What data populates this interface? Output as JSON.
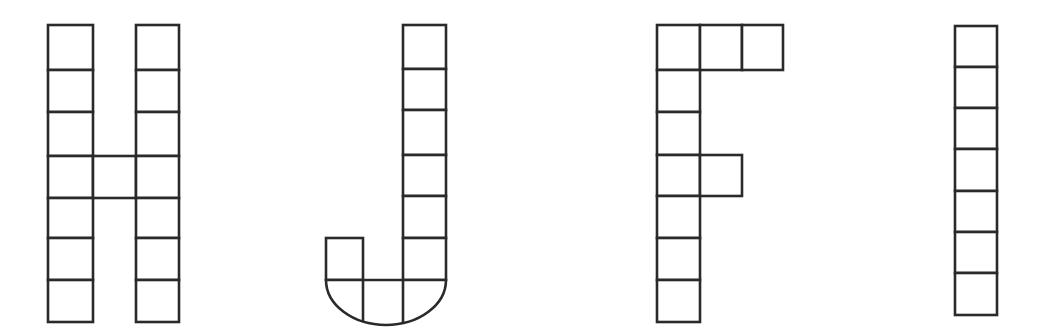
{
  "diagram": {
    "stroke_color": "#2a2a2a",
    "background": "#ffffff",
    "letters": [
      {
        "letter": "H",
        "cell_count": 15,
        "cells": [
          {
            "x": 48,
            "y": 25,
            "w": 45,
            "h": 45
          },
          {
            "x": 48,
            "y": 70,
            "w": 45,
            "h": 42
          },
          {
            "x": 48,
            "y": 112,
            "w": 45,
            "h": 44
          },
          {
            "x": 48,
            "y": 156,
            "w": 45,
            "h": 42
          },
          {
            "x": 48,
            "y": 198,
            "w": 45,
            "h": 40
          },
          {
            "x": 48,
            "y": 238,
            "w": 45,
            "h": 42
          },
          {
            "x": 48,
            "y": 280,
            "w": 45,
            "h": 42
          },
          {
            "x": 93,
            "y": 156,
            "w": 43,
            "h": 42
          },
          {
            "x": 136,
            "y": 25,
            "w": 43,
            "h": 45
          },
          {
            "x": 136,
            "y": 70,
            "w": 43,
            "h": 42
          },
          {
            "x": 136,
            "y": 112,
            "w": 43,
            "h": 44
          },
          {
            "x": 136,
            "y": 156,
            "w": 43,
            "h": 42
          },
          {
            "x": 136,
            "y": 198,
            "w": 43,
            "h": 40
          },
          {
            "x": 136,
            "y": 238,
            "w": 43,
            "h": 42
          },
          {
            "x": 136,
            "y": 280,
            "w": 43,
            "h": 42
          }
        ]
      },
      {
        "letter": "J",
        "cell_count": 10,
        "cells": [
          {
            "x": 403,
            "y": 25,
            "w": 43,
            "h": 44
          },
          {
            "x": 403,
            "y": 69,
            "w": 43,
            "h": 41
          },
          {
            "x": 403,
            "y": 110,
            "w": 43,
            "h": 45
          },
          {
            "x": 403,
            "y": 155,
            "w": 43,
            "h": 41
          },
          {
            "x": 403,
            "y": 196,
            "w": 43,
            "h": 42
          },
          {
            "x": 403,
            "y": 238,
            "w": 43,
            "h": 42
          },
          {
            "x": 326,
            "y": 238,
            "w": 37,
            "h": 42
          }
        ],
        "bottom_arc": {
          "x_left": 326,
          "x_right": 446,
          "y_top": 280,
          "y_bottom": 325,
          "dividers_x": [
            363,
            403
          ]
        }
      },
      {
        "letter": "F",
        "cell_count": 10,
        "cells": [
          {
            "x": 657,
            "y": 25,
            "w": 43,
            "h": 45
          },
          {
            "x": 700,
            "y": 25,
            "w": 42,
            "h": 45
          },
          {
            "x": 742,
            "y": 25,
            "w": 41,
            "h": 45
          },
          {
            "x": 657,
            "y": 70,
            "w": 43,
            "h": 42
          },
          {
            "x": 657,
            "y": 112,
            "w": 43,
            "h": 43
          },
          {
            "x": 657,
            "y": 155,
            "w": 43,
            "h": 41
          },
          {
            "x": 700,
            "y": 155,
            "w": 42,
            "h": 41
          },
          {
            "x": 657,
            "y": 196,
            "w": 43,
            "h": 42
          },
          {
            "x": 657,
            "y": 238,
            "w": 43,
            "h": 42
          },
          {
            "x": 657,
            "y": 280,
            "w": 43,
            "h": 42
          }
        ]
      },
      {
        "letter": "I",
        "cell_count": 7,
        "cells": [
          {
            "x": 955,
            "y": 26,
            "w": 42,
            "h": 41
          },
          {
            "x": 955,
            "y": 67,
            "w": 42,
            "h": 41
          },
          {
            "x": 955,
            "y": 108,
            "w": 42,
            "h": 41
          },
          {
            "x": 955,
            "y": 149,
            "w": 42,
            "h": 42
          },
          {
            "x": 955,
            "y": 191,
            "w": 42,
            "h": 41
          },
          {
            "x": 955,
            "y": 232,
            "w": 42,
            "h": 41
          },
          {
            "x": 955,
            "y": 273,
            "w": 42,
            "h": 42
          }
        ]
      }
    ]
  }
}
